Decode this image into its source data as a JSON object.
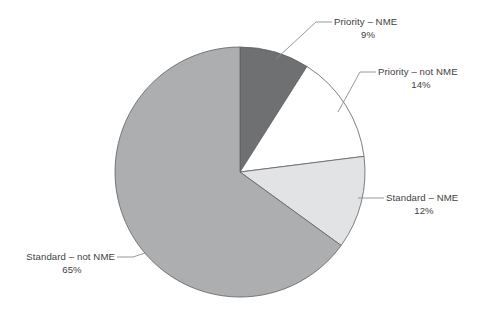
{
  "chart_data": {
    "type": "pie",
    "title": "",
    "subtitle": "",
    "xlabel": "",
    "ylabel": "",
    "legend_position": "none",
    "grid": false,
    "units": "percent",
    "total": 100,
    "start_angle_deg": 0,
    "direction": "clockwise",
    "categories": [
      "Priority – NME",
      "Priority – not NME",
      "Standard – NME",
      "Standard – not NME"
    ],
    "values": [
      9,
      14,
      12,
      65
    ],
    "value_labels": [
      "9%",
      "14%",
      "12%",
      "65%"
    ],
    "colors": [
      "#6f7072",
      "#ffffff",
      "#e2e3e4",
      "#adaeb0"
    ],
    "slices": [
      {
        "label": "Priority – NME",
        "value": 9,
        "value_label": "9%",
        "color": "#6f7072",
        "start_deg": 0,
        "end_deg": 32.4
      },
      {
        "label": "Priority – not NME",
        "value": 14,
        "value_label": "14%",
        "color": "#ffffff",
        "start_deg": 32.4,
        "end_deg": 82.8
      },
      {
        "label": "Standard – NME",
        "value": 12,
        "value_label": "12%",
        "color": "#e2e3e4",
        "start_deg": 82.8,
        "end_deg": 126.0
      },
      {
        "label": "Standard – not NME",
        "value": 65,
        "value_label": "65%",
        "color": "#adaeb0",
        "start_deg": 126.0,
        "end_deg": 360.0
      }
    ]
  },
  "style": {
    "background": "#ffffff",
    "text_color": "#3f4042",
    "leader_color": "#8b8d8f",
    "slice_outline": "#5e6063"
  }
}
